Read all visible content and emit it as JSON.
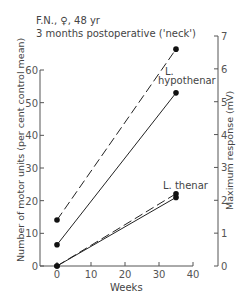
{
  "chart_data": {
    "type": "line",
    "title": "F.N., ♀, 48 yr",
    "subtitle": "3 months postoperative ('neck')",
    "xlabel": "Weeks",
    "ylabel": "Number of motor units (per cent control mean)",
    "y2label": "Maximum response (mV)",
    "xlim": [
      0,
      40
    ],
    "ylim": [
      0,
      60
    ],
    "y2lim": [
      0,
      7
    ],
    "xticks": [
      "0",
      "10",
      "20",
      "30",
      "40"
    ],
    "yticks": [
      "0",
      "10",
      "20",
      "30",
      "40",
      "50",
      "60"
    ],
    "y2ticks": [
      "0",
      "1",
      "2",
      "3",
      "4",
      "5",
      "6",
      "7"
    ],
    "grid": false,
    "series": [
      {
        "name": "L. hypothenar – maximum response (mV)",
        "style": "dashed",
        "axis": "right",
        "x": [
          0,
          35
        ],
        "values": [
          1.4,
          6.6
        ]
      },
      {
        "name": "L. hypothenar – number of motor units (%)",
        "style": "solid",
        "axis": "left",
        "x": [
          0,
          35
        ],
        "values": [
          6.5,
          53
        ]
      },
      {
        "name": "L. thenar – maximum response (mV)",
        "style": "dashed",
        "axis": "right",
        "x": [
          0,
          35
        ],
        "values": [
          0,
          2.2
        ]
      },
      {
        "name": "L. thenar – number of motor units (%)",
        "style": "solid",
        "axis": "left",
        "x": [
          0,
          35
        ],
        "values": [
          0,
          21
        ]
      }
    ],
    "annotations": [
      "L. hypothenar",
      "L. thenar"
    ]
  },
  "labels": {
    "title": "F.N., ♀, 48 yr",
    "subtitle": "3 months postoperative ('neck')",
    "xlabel": "Weeks",
    "ylabel": "Number of motor units (per cent control mean)",
    "y2label": "Maximum response (mV)",
    "hypo_line1": "L.",
    "hypo_line2": "hypothenar",
    "thenar": "L. thenar"
  }
}
